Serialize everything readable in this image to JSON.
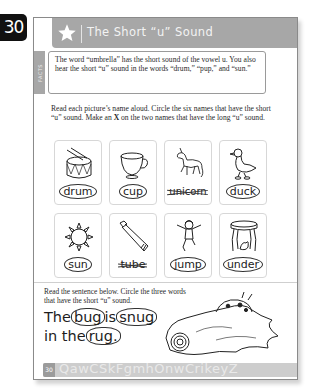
{
  "page_number": "30",
  "header": {
    "icon": "star-icon",
    "title": "The Short “u” Sound"
  },
  "facts": {
    "tab_label": "FACTS",
    "text": "The word “umbrella” has the short sound of the vowel u. You also hear the short “u” sound in the words “drum,” “pup,” and “sun.”"
  },
  "instructions": {
    "part1": "Read each picture’s name aloud. Circle the six names that have the short “u” sound. Make an ",
    "bold": "X",
    "part2": " on the two names that have the long “u” sound."
  },
  "pictures": [
    {
      "word": "drum",
      "icon": "drum-icon",
      "mark": "circled"
    },
    {
      "word": "cup",
      "icon": "cup-icon",
      "mark": "circled"
    },
    {
      "word": "unicorn",
      "icon": "unicorn-icon",
      "mark": "crossed"
    },
    {
      "word": "duck",
      "icon": "duck-icon",
      "mark": "circled"
    },
    {
      "word": "sun",
      "icon": "sun-icon",
      "mark": "circled"
    },
    {
      "word": "tube",
      "icon": "tube-icon",
      "mark": "crossed"
    },
    {
      "word": "jump",
      "icon": "jumping-child-icon",
      "mark": "circled"
    },
    {
      "word": "under",
      "icon": "table-with-cat-under-icon",
      "mark": "circled"
    }
  ],
  "sentence_section": {
    "instruction": "Read the sentence below. Circle the three words that have the short “u” sound.",
    "words": [
      "The",
      "bug",
      "is",
      "snug",
      "in the",
      "rug."
    ],
    "circled": [
      "bug",
      "snug",
      "rug."
    ],
    "illustration": "bug-under-rug-icon"
  },
  "footer": {
    "page_number": "30",
    "letters": "QawCSkFgmhOnwCrikeyZ"
  }
}
